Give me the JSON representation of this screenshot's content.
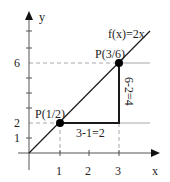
{
  "diagram": {
    "axes": {
      "x_label": "x",
      "y_label": "y",
      "x_ticks": [
        "1",
        "2",
        "3"
      ],
      "y_ticks": [
        "1",
        "2",
        "6"
      ]
    },
    "function_label": "f(x)=2x",
    "points": [
      {
        "label": "P(1/2)",
        "x": 1,
        "y": 2
      },
      {
        "label": "P(3/6)",
        "x": 3,
        "y": 6
      }
    ],
    "horizontal_leg_label": "3-1=2",
    "vertical_leg_label": "6-2=4",
    "colors": {
      "line": "#1a1a1a",
      "guide": "#a0a0a0",
      "axis": "#555555",
      "point": "#000000"
    }
  }
}
